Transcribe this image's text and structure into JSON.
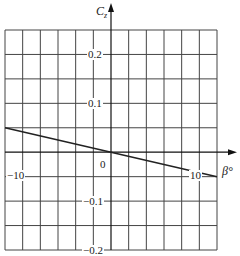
{
  "chart_data": {
    "type": "line",
    "title": "",
    "xlabel": "β°",
    "ylabel": "C_z",
    "xlim": [
      -12,
      12
    ],
    "ylim": [
      -0.2,
      0.25
    ],
    "x_step": 2,
    "y_step": 0.05,
    "grid": true,
    "x_tick_labels": [
      {
        "value": -10,
        "label": "−10"
      },
      {
        "value": 0,
        "label": "0"
      },
      {
        "value": 10,
        "label": "10"
      }
    ],
    "y_tick_labels": [
      {
        "value": 0.2,
        "label": "0.2"
      },
      {
        "value": 0.1,
        "label": "0.1"
      },
      {
        "value": -0.1,
        "label": "−0.1"
      },
      {
        "value": -0.2,
        "label": "−0.2"
      }
    ],
    "series": [
      {
        "name": "C_z vs β",
        "x": [
          -12,
          0,
          12
        ],
        "values": [
          0.05,
          0.0,
          -0.05
        ]
      }
    ]
  },
  "labels": {
    "y_axis_main": "C",
    "y_axis_sub": "z",
    "x_axis": "β°",
    "tick_neg10": "−10",
    "tick_0": "0",
    "tick_10": "10",
    "tick_y_02": "0.2",
    "tick_y_01": "0.1",
    "tick_y_m01": "−0.1",
    "tick_y_m02": "−0.2"
  },
  "colors": {
    "grid": "#444444",
    "line": "#222222",
    "axis": "#111111"
  }
}
